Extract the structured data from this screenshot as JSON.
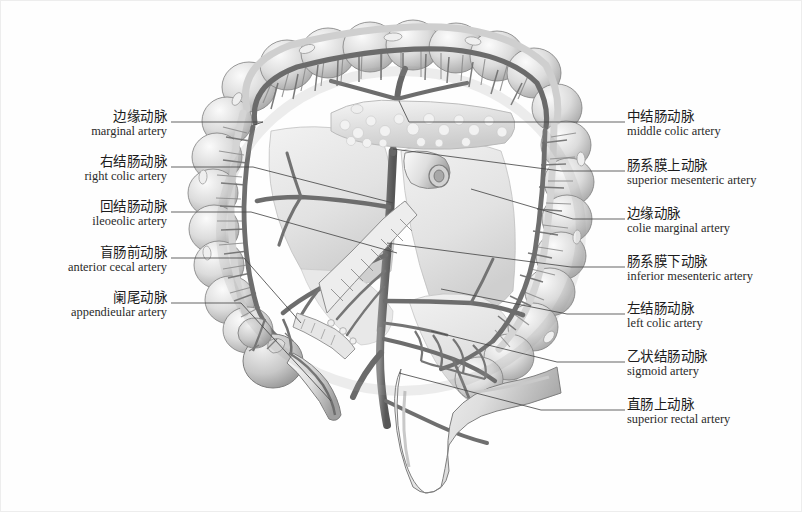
{
  "figure": {
    "style": "grayscale anatomical illustration",
    "background_color": "#fefefe",
    "line_color": "#4a4a4a",
    "ink_color": "#1c1c1c"
  },
  "labels_left": [
    {
      "cn": "边缘动脉",
      "en": "marginal artery",
      "name": "marginal-artery"
    },
    {
      "cn": "右结肠动脉",
      "en": "right colic artery",
      "name": "right-colic-artery"
    },
    {
      "cn": "回结肠动脉",
      "en": "ileoeolic artery",
      "name": "ileocolic-artery"
    },
    {
      "cn": "盲肠前动脉",
      "en": "anterior cecal artery",
      "name": "anterior-cecal-artery"
    },
    {
      "cn": "阑尾动脉",
      "en": "appendieular artery",
      "name": "appendicular-artery"
    }
  ],
  "labels_right": [
    {
      "cn": "中结肠动脉",
      "en": "middle colic artery",
      "name": "middle-colic-artery"
    },
    {
      "cn": "肠系膜上动脉",
      "en": "superior mesenteric artery",
      "name": "superior-mesenteric-artery"
    },
    {
      "cn": "边缘动脉",
      "en": "colie marginal artery",
      "name": "colic-marginal-artery"
    },
    {
      "cn": "肠系膜下动脉",
      "en": "inferior mesenteric artery",
      "name": "inferior-mesenteric-artery"
    },
    {
      "cn": "左结肠动脉",
      "en": "left colic artery",
      "name": "left-colic-artery"
    },
    {
      "cn": "乙状结肠动脉",
      "en": "sigmoid artery",
      "name": "sigmoid-artery"
    },
    {
      "cn": "直肠上动脉",
      "en": "superior rectal artery",
      "name": "superior-rectal-artery"
    }
  ]
}
